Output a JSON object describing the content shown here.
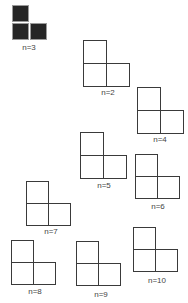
{
  "figure": {
    "items": [
      {
        "label": "n=3",
        "x": 12,
        "y": 5,
        "s": 17,
        "dark": true,
        "label_x": 29,
        "label_y": 44
      },
      {
        "label": "n=2",
        "x": 83,
        "y": 40,
        "s": 24,
        "dark": false,
        "label_x": 108,
        "label_y": 89
      },
      {
        "label": "n=4",
        "x": 137,
        "y": 87,
        "s": 24,
        "dark": false,
        "label_x": 160,
        "label_y": 136
      },
      {
        "label": "n=5",
        "x": 80,
        "y": 132,
        "s": 24,
        "dark": false,
        "label_x": 104,
        "label_y": 182
      },
      {
        "label": "n=6",
        "x": 135,
        "y": 154,
        "s": 23,
        "dark": false,
        "label_x": 158,
        "label_y": 203
      },
      {
        "label": "n=7",
        "x": 26,
        "y": 181,
        "s": 23,
        "dark": false,
        "label_x": 51,
        "label_y": 228
      },
      {
        "label": "n=8",
        "x": 11,
        "y": 240,
        "s": 23,
        "dark": false,
        "label_x": 35,
        "label_y": 288
      },
      {
        "label": "n=9",
        "x": 76,
        "y": 241,
        "s": 23,
        "dark": false,
        "label_x": 101,
        "label_y": 291
      },
      {
        "label": "n=10",
        "x": 133,
        "y": 227,
        "s": 23,
        "dark": false,
        "label_x": 157,
        "label_y": 277
      }
    ]
  }
}
